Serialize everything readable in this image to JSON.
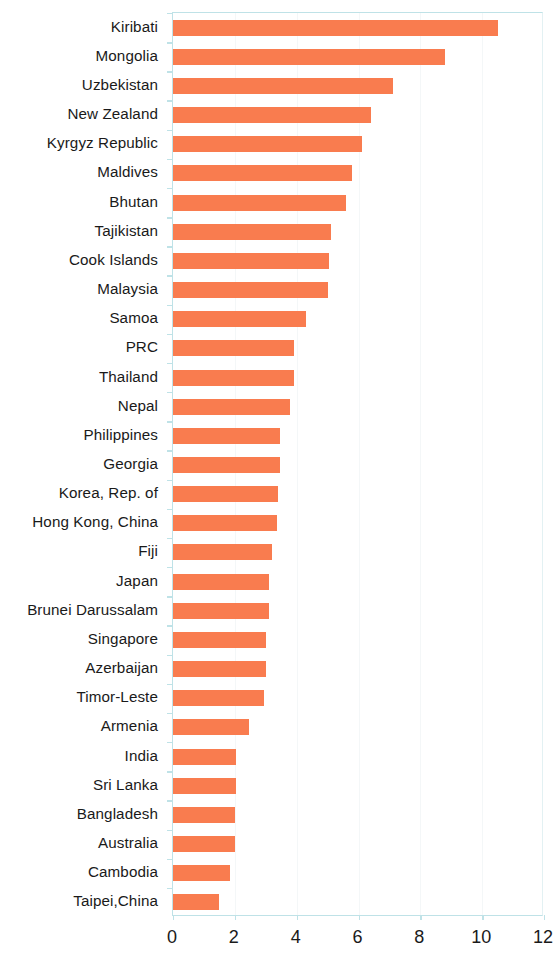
{
  "chart_data": {
    "type": "bar",
    "orientation": "horizontal",
    "title": "",
    "subtitle": "",
    "xlabel": "",
    "ylabel": "",
    "xlim": [
      0,
      12
    ],
    "ylim": null,
    "grid": "vertical-faint",
    "legend": null,
    "bar_color": "#f97c4f",
    "axis_color": "#bfe2e7",
    "xticks": [
      0,
      2,
      4,
      6,
      8,
      10,
      12
    ],
    "xtick_labels": [
      "0",
      "2",
      "4",
      "6",
      "8",
      "10",
      "12"
    ],
    "categories": [
      "Kiribati",
      "Mongolia",
      "Uzbekistan",
      "New Zealand",
      "Kyrgyz Republic",
      "Maldives",
      "Bhutan",
      "Tajikistan",
      "Cook Islands",
      "Malaysia",
      "Samoa",
      "PRC",
      "Thailand",
      "Nepal",
      "Philippines",
      "Georgia",
      "Korea, Rep. of",
      "Hong Kong, China",
      "Fiji",
      "Japan",
      "Brunei Darussalam",
      "Singapore",
      "Azerbaijan",
      "Timor-Leste",
      "Armenia",
      "India",
      "Sri Lanka",
      "Bangladesh",
      "Australia",
      "Cambodia",
      "Taipei,China"
    ],
    "values": [
      10.5,
      8.8,
      7.1,
      6.4,
      6.1,
      5.8,
      5.6,
      5.1,
      5.05,
      5.0,
      4.3,
      3.9,
      3.9,
      3.8,
      3.45,
      3.45,
      3.4,
      3.35,
      3.2,
      3.1,
      3.1,
      3.0,
      3.0,
      2.95,
      2.45,
      2.05,
      2.05,
      2.0,
      2.0,
      1.85,
      1.5
    ]
  }
}
